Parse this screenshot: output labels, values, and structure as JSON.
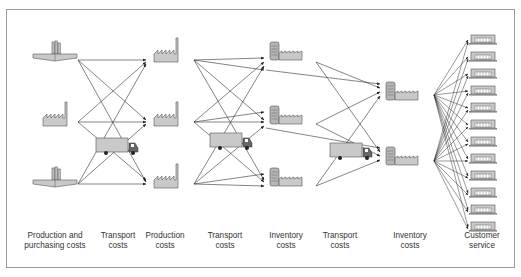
{
  "diagram": {
    "stages": [
      {
        "id": "suppliers",
        "label": "Production and\npurchasing costs",
        "x": 55
      },
      {
        "id": "transport1",
        "label": "Transport\ncosts",
        "x": 118
      },
      {
        "id": "plants",
        "label": "Production\ncosts",
        "x": 165
      },
      {
        "id": "transport2",
        "label": "Transport\ncosts",
        "x": 225
      },
      {
        "id": "warehouses1",
        "label": "Inventory\ncosts",
        "x": 286
      },
      {
        "id": "transport3",
        "label": "Transport\ncosts",
        "x": 340
      },
      {
        "id": "warehouses2",
        "label": "Inventory\ncosts",
        "x": 410
      },
      {
        "id": "customers",
        "label": "Customer\nservice",
        "x": 482
      }
    ],
    "nodes": {
      "suppliers": [
        {
          "type": "refinery",
          "x": 55,
          "y": 58
        },
        {
          "type": "factory",
          "x": 55,
          "y": 122
        },
        {
          "type": "refinery",
          "x": 55,
          "y": 184
        }
      ],
      "plants": [
        {
          "type": "factory",
          "x": 170,
          "y": 58
        },
        {
          "type": "factory",
          "x": 170,
          "y": 122
        },
        {
          "type": "factory",
          "x": 170,
          "y": 184
        }
      ],
      "warehouses1": [
        {
          "type": "warehouse",
          "x": 288,
          "y": 52
        },
        {
          "type": "warehouse",
          "x": 288,
          "y": 118
        },
        {
          "type": "warehouse",
          "x": 288,
          "y": 178
        }
      ],
      "warehouses2": [
        {
          "type": "warehouse",
          "x": 410,
          "y": 92
        },
        {
          "type": "warehouse",
          "x": 410,
          "y": 158
        }
      ],
      "customers": {
        "count": 12,
        "x": 483,
        "y_start": 40,
        "y_step": 17
      }
    },
    "trucks": [
      {
        "x": 117,
        "y": 146
      },
      {
        "x": 229,
        "y": 141
      },
      {
        "x": 348,
        "y": 151
      }
    ],
    "colors": {
      "fill": "#c9c9c9",
      "stroke": "#555555",
      "line": "#333333",
      "frame": "#9a9a9a"
    }
  }
}
